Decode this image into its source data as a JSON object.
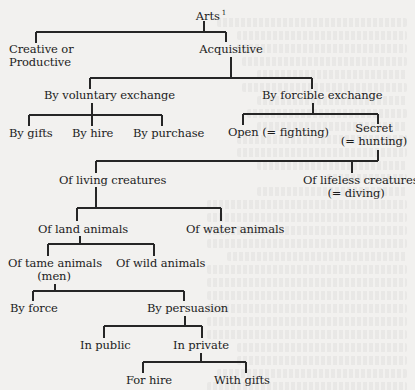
{
  "diagram": {
    "title": "Arts",
    "title_footnote": "1",
    "nodes": [
      {
        "id": "arts",
        "lines": [
          "Arts"
        ],
        "footnote": "1",
        "x": 191,
        "y": 7,
        "w": 40,
        "align": "center"
      },
      {
        "id": "creative",
        "lines": [
          "Creative or",
          "Productive"
        ],
        "x": 9,
        "y": 43,
        "w": 80,
        "align": "left"
      },
      {
        "id": "acquisitive",
        "lines": [
          "Acquisitive"
        ],
        "x": 196,
        "y": 43,
        "w": 70,
        "align": "center"
      },
      {
        "id": "voluntary",
        "lines": [
          "By voluntary exchange"
        ],
        "x": 42,
        "y": 89,
        "w": 135,
        "align": "center"
      },
      {
        "id": "forcible",
        "lines": [
          "By forcible exchange"
        ],
        "x": 262,
        "y": 89,
        "w": 112,
        "align": "center"
      },
      {
        "id": "gifts",
        "lines": [
          "By gifts"
        ],
        "x": 9,
        "y": 127,
        "w": 48,
        "align": "left"
      },
      {
        "id": "hire",
        "lines": [
          "By hire"
        ],
        "x": 72,
        "y": 127,
        "w": 44,
        "align": "left"
      },
      {
        "id": "purchase",
        "lines": [
          "By purchase"
        ],
        "x": 133,
        "y": 127,
        "w": 68,
        "align": "left"
      },
      {
        "id": "open",
        "lines": [
          "Open (= fighting)"
        ],
        "x": 228,
        "y": 126,
        "w": 95,
        "align": "left"
      },
      {
        "id": "secret",
        "lines": [
          "Secret",
          "(= hunting)"
        ],
        "x": 340,
        "y": 122,
        "w": 68,
        "align": "center"
      },
      {
        "id": "living",
        "lines": [
          "Of living creatures"
        ],
        "x": 59,
        "y": 174,
        "w": 100,
        "align": "left"
      },
      {
        "id": "lifeless",
        "lines": [
          "Of lifeless creatures",
          "(= diving)"
        ],
        "x": 303,
        "y": 174,
        "w": 106,
        "align": "center"
      },
      {
        "id": "land",
        "lines": [
          "Of land animals"
        ],
        "x": 38,
        "y": 223,
        "w": 86,
        "align": "left"
      },
      {
        "id": "water",
        "lines": [
          "Of water animals"
        ],
        "x": 186,
        "y": 223,
        "w": 92,
        "align": "left"
      },
      {
        "id": "tame",
        "lines": [
          "Of tame animals",
          "(men)"
        ],
        "x": 8,
        "y": 257,
        "w": 92,
        "align": "center"
      },
      {
        "id": "wild",
        "lines": [
          "Of wild animals"
        ],
        "x": 116,
        "y": 257,
        "w": 86,
        "align": "left"
      },
      {
        "id": "force",
        "lines": [
          "By force"
        ],
        "x": 10,
        "y": 302,
        "w": 52,
        "align": "left"
      },
      {
        "id": "persuasion",
        "lines": [
          "By persuasion"
        ],
        "x": 147,
        "y": 302,
        "w": 76,
        "align": "left"
      },
      {
        "id": "public",
        "lines": [
          "In public"
        ],
        "x": 80,
        "y": 339,
        "w": 52,
        "align": "left"
      },
      {
        "id": "private",
        "lines": [
          "In private"
        ],
        "x": 173,
        "y": 339,
        "w": 58,
        "align": "left"
      },
      {
        "id": "forhire",
        "lines": [
          "For hire"
        ],
        "x": 126,
        "y": 374,
        "w": 50,
        "align": "left"
      },
      {
        "id": "withgifts",
        "lines": [
          "With gifts"
        ],
        "x": 214,
        "y": 374,
        "w": 56,
        "align": "left"
      }
    ],
    "edges": [
      {
        "parent": "arts",
        "children": [
          "creative",
          "acquisitive"
        ]
      },
      {
        "parent": "acquisitive",
        "children": [
          "voluntary",
          "forcible"
        ]
      },
      {
        "parent": "voluntary",
        "children": [
          "gifts",
          "hire",
          "purchase"
        ]
      },
      {
        "parent": "forcible",
        "children": [
          "open",
          "secret"
        ]
      },
      {
        "parent": "secret",
        "children": [
          "living",
          "lifeless"
        ]
      },
      {
        "parent": "living",
        "children": [
          "land",
          "water"
        ]
      },
      {
        "parent": "land",
        "children": [
          "tame",
          "wild"
        ]
      },
      {
        "parent": "tame",
        "children": [
          "force",
          "persuasion"
        ]
      },
      {
        "parent": "persuasion",
        "children": [
          "public",
          "private"
        ]
      },
      {
        "parent": "private",
        "children": [
          "forhire",
          "withgifts"
        ]
      }
    ],
    "connectors": [
      {
        "x1": 204,
        "y1": 21,
        "x2": 204,
        "y2": 32
      },
      {
        "x1": 36,
        "y1": 32,
        "x2": 226,
        "y2": 32
      },
      {
        "x1": 36,
        "y1": 32,
        "x2": 36,
        "y2": 43
      },
      {
        "x1": 226,
        "y1": 32,
        "x2": 226,
        "y2": 42
      },
      {
        "x1": 231,
        "y1": 57,
        "x2": 231,
        "y2": 78
      },
      {
        "x1": 90,
        "y1": 78,
        "x2": 312,
        "y2": 78
      },
      {
        "x1": 90,
        "y1": 78,
        "x2": 90,
        "y2": 89
      },
      {
        "x1": 312,
        "y1": 78,
        "x2": 312,
        "y2": 89
      },
      {
        "x1": 92,
        "y1": 103,
        "x2": 92,
        "y2": 115
      },
      {
        "x1": 29,
        "y1": 115,
        "x2": 162,
        "y2": 115
      },
      {
        "x1": 29,
        "y1": 115,
        "x2": 29,
        "y2": 126
      },
      {
        "x1": 92,
        "y1": 115,
        "x2": 92,
        "y2": 126
      },
      {
        "x1": 162,
        "y1": 115,
        "x2": 162,
        "y2": 126
      },
      {
        "x1": 313,
        "y1": 103,
        "x2": 313,
        "y2": 114
      },
      {
        "x1": 243,
        "y1": 114,
        "x2": 378,
        "y2": 114
      },
      {
        "x1": 243,
        "y1": 114,
        "x2": 243,
        "y2": 125
      },
      {
        "x1": 378,
        "y1": 114,
        "x2": 378,
        "y2": 124
      },
      {
        "x1": 378,
        "y1": 150,
        "x2": 378,
        "y2": 161
      },
      {
        "x1": 96,
        "y1": 161,
        "x2": 378,
        "y2": 161
      },
      {
        "x1": 96,
        "y1": 161,
        "x2": 96,
        "y2": 173
      },
      {
        "x1": 352,
        "y1": 161,
        "x2": 352,
        "y2": 173
      },
      {
        "x1": 96,
        "y1": 187,
        "x2": 96,
        "y2": 208
      },
      {
        "x1": 77,
        "y1": 208,
        "x2": 221,
        "y2": 208
      },
      {
        "x1": 77,
        "y1": 208,
        "x2": 77,
        "y2": 221
      },
      {
        "x1": 221,
        "y1": 208,
        "x2": 221,
        "y2": 221
      },
      {
        "x1": 80,
        "y1": 236,
        "x2": 80,
        "y2": 244
      },
      {
        "x1": 48,
        "y1": 244,
        "x2": 154,
        "y2": 244
      },
      {
        "x1": 48,
        "y1": 244,
        "x2": 48,
        "y2": 256
      },
      {
        "x1": 154,
        "y1": 244,
        "x2": 154,
        "y2": 256
      },
      {
        "x1": 55,
        "y1": 284,
        "x2": 55,
        "y2": 291
      },
      {
        "x1": 33,
        "y1": 291,
        "x2": 184,
        "y2": 291
      },
      {
        "x1": 33,
        "y1": 291,
        "x2": 33,
        "y2": 301
      },
      {
        "x1": 184,
        "y1": 291,
        "x2": 184,
        "y2": 301
      },
      {
        "x1": 185,
        "y1": 316,
        "x2": 185,
        "y2": 326
      },
      {
        "x1": 104,
        "y1": 326,
        "x2": 202,
        "y2": 326
      },
      {
        "x1": 104,
        "y1": 326,
        "x2": 104,
        "y2": 338
      },
      {
        "x1": 202,
        "y1": 326,
        "x2": 202,
        "y2": 338
      },
      {
        "x1": 201,
        "y1": 353,
        "x2": 201,
        "y2": 362
      },
      {
        "x1": 143,
        "y1": 362,
        "x2": 246,
        "y2": 362
      },
      {
        "x1": 143,
        "y1": 362,
        "x2": 143,
        "y2": 373
      },
      {
        "x1": 246,
        "y1": 362,
        "x2": 246,
        "y2": 373
      }
    ]
  },
  "colors": {
    "page_background": "#f2f1ef",
    "ink": "#1c1c1c",
    "line": "#262626"
  }
}
